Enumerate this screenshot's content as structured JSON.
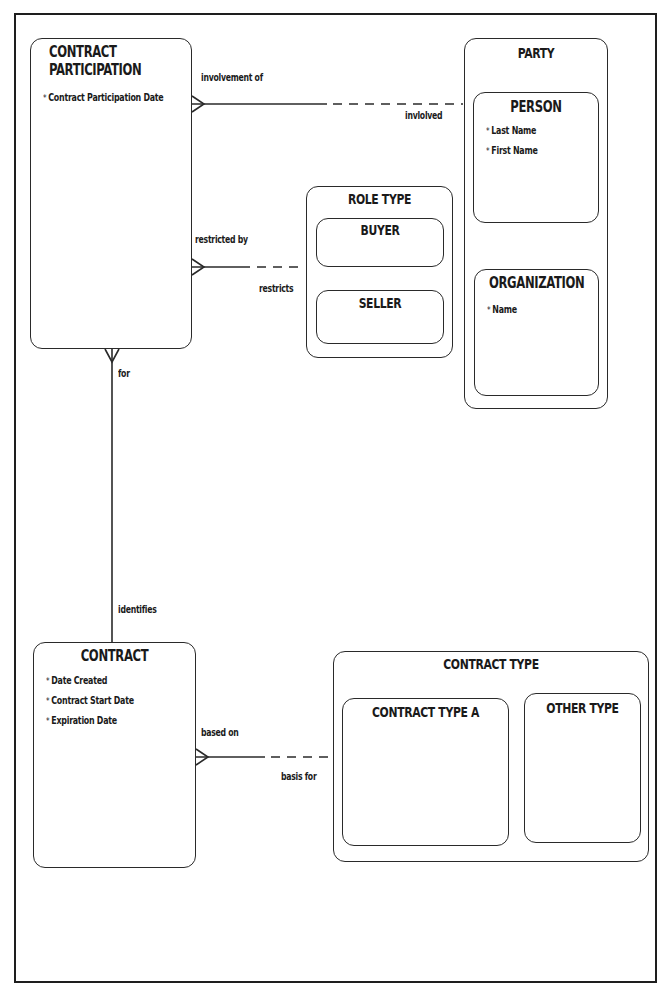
{
  "diagram": {
    "type": "entity-relationship",
    "entities": {
      "contract_participation": {
        "title_line1": "CONTRACT",
        "title_line2": "PARTICIPATION",
        "attributes": [
          "Contract Participation Date"
        ]
      },
      "party": {
        "title": "PARTY",
        "subtypes": {
          "person": {
            "title": "PERSON",
            "attributes": [
              "Last Name",
              "First Name"
            ]
          },
          "organization": {
            "title": "ORGANIZATION",
            "attributes": [
              "Name"
            ]
          }
        }
      },
      "role_type": {
        "title": "ROLE TYPE",
        "subtypes": {
          "buyer": {
            "title": "BUYER"
          },
          "seller": {
            "title": "SELLER"
          }
        }
      },
      "contract": {
        "title": "CONTRACT",
        "attributes": [
          "Date Created",
          "Contract Start Date",
          "Expiration Date"
        ]
      },
      "contract_type": {
        "title": "CONTRACT TYPE",
        "subtypes": {
          "contract_type_a": {
            "title": "CONTRACT TYPE A"
          },
          "other_type": {
            "title": "OTHER TYPE"
          }
        }
      }
    },
    "relationships": {
      "participation_party": {
        "from_label": "involvement of",
        "to_label": "invlolved",
        "from": "CONTRACT PARTICIPATION",
        "to": "PARTY",
        "from_cardinality": "many",
        "to_optional": true
      },
      "participation_role": {
        "from_label": "restricted by",
        "to_label": "restricts",
        "from": "CONTRACT PARTICIPATION",
        "to": "ROLE TYPE",
        "from_cardinality": "many",
        "to_optional": true
      },
      "participation_contract": {
        "from_label": "for",
        "to_label": "identifies",
        "from": "CONTRACT PARTICIPATION",
        "to": "CONTRACT",
        "from_cardinality": "many"
      },
      "contract_type": {
        "from_label": "based on",
        "to_label": "basis for",
        "from": "CONTRACT",
        "to": "CONTRACT TYPE",
        "from_cardinality": "many",
        "to_optional": true
      }
    }
  }
}
